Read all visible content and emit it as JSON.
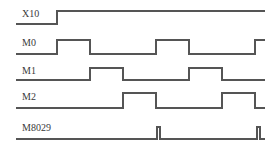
{
  "diagram": {
    "title": "",
    "type": "timing-diagram",
    "stroke_color": "#555555",
    "label_color": "#3a3a3a",
    "background": "#ffffff",
    "x_start": 16,
    "x_end": 265,
    "signals": [
      {
        "name": "X10",
        "label_x": 22,
        "label_y": 8,
        "low_y": 24,
        "high_y": 11,
        "initial": 0,
        "transitions": [
          57
        ]
      },
      {
        "name": "M0",
        "label_x": 22,
        "label_y": 37,
        "low_y": 54,
        "high_y": 40,
        "initial": 0,
        "transitions": [
          57,
          90,
          156,
          189,
          255
        ]
      },
      {
        "name": "M1",
        "label_x": 22,
        "label_y": 65,
        "low_y": 80,
        "high_y": 68,
        "initial": 0,
        "transitions": [
          90,
          123,
          189,
          222
        ]
      },
      {
        "name": "M2",
        "label_x": 22,
        "label_y": 91,
        "low_y": 108,
        "high_y": 93,
        "initial": 0,
        "transitions": [
          123,
          156,
          222,
          255
        ]
      },
      {
        "name": "M8029",
        "label_x": 22,
        "label_y": 122,
        "low_y": 139,
        "high_y": 127,
        "initial": 0,
        "transitions": [
          157,
          160,
          257,
          260
        ]
      }
    ]
  }
}
